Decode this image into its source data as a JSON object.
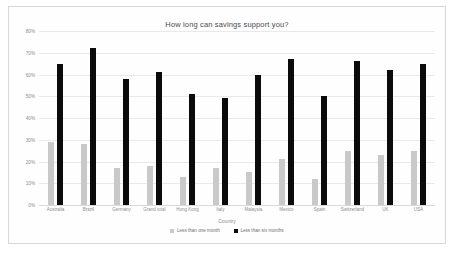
{
  "chart_data": {
    "type": "bar",
    "title": "How long can savings support you?",
    "xlabel": "Country",
    "ylabel": "",
    "ylim": [
      0,
      80
    ],
    "ytick_labels": [
      "80%",
      "70%",
      "60%",
      "50%",
      "40%",
      "30%",
      "20%",
      "10%",
      "0%"
    ],
    "ytick_values": [
      80,
      70,
      60,
      50,
      40,
      30,
      20,
      10,
      0
    ],
    "grid": true,
    "legend_position": "bottom",
    "categories": [
      "Australia",
      "Brazil",
      "Germany",
      "Grand total",
      "Hong Kong",
      "Italy",
      "Malaysia",
      "Mexico",
      "Spain",
      "Switzerland",
      "UK",
      "USA"
    ],
    "series": [
      {
        "name": "Less than one month",
        "color": "#c9c9c9",
        "values": [
          29,
          28,
          17,
          18,
          13,
          17,
          15,
          21,
          12,
          25,
          23,
          25
        ]
      },
      {
        "name": "Less than six months",
        "color": "#0b0b0b",
        "values": [
          65,
          72,
          58,
          61,
          51,
          49,
          60,
          67,
          50,
          66,
          62,
          65
        ]
      }
    ]
  },
  "colors": {
    "one_month": "#c9c9c9",
    "six_months": "#0b0b0b",
    "grid": "#e9e9e9",
    "text": "#8d8d8d",
    "title": "#4a4a4a",
    "card_border": "#d8d8d8"
  }
}
